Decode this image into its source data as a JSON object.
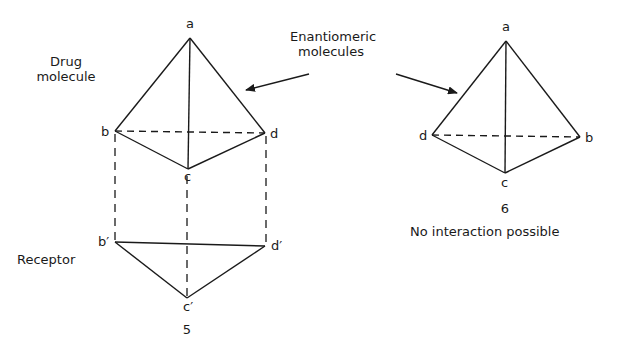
{
  "labels": {
    "drug_molecule_line1": "Drug",
    "drug_molecule_line2": "molecule",
    "enantiomeric_line1": "Enantiomeric",
    "enantiomeric_line2": "molecules",
    "receptor": "Receptor",
    "figure5_number": "5",
    "figure6_number": "6",
    "figure6_caption": "No interaction possible"
  },
  "left_tetrahedron": {
    "vertices": {
      "a": "a",
      "b": "b",
      "c": "c",
      "d": "d"
    }
  },
  "receptor_triangle": {
    "vertices": {
      "b_prime": "b′",
      "c_prime": "c′",
      "d_prime": "d′"
    }
  },
  "right_tetrahedron": {
    "vertices": {
      "a": "a",
      "b": "b",
      "c": "c",
      "d": "d"
    }
  },
  "colors": {
    "line": "#1a1a1a",
    "background": "#ffffff"
  }
}
